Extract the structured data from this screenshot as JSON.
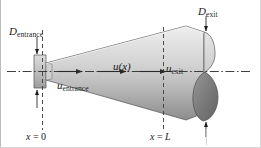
{
  "figure": {
    "colors": {
      "line": "#1a1a1a",
      "body_light": "#e4e4e4",
      "body_mid": "#c4c4c4",
      "body_dark": "#8f8f8f",
      "inner_dark": "#6f6f6f",
      "flange": "#b9b9b9",
      "border": "#b4b4b4",
      "background": "#ffffff"
    },
    "labels": {
      "d_entrance": {
        "symbol": "D",
        "subscript": "entrance"
      },
      "d_exit": {
        "symbol": "D",
        "subscript": "exit"
      },
      "u_x": {
        "symbol": "u",
        "argument": "(x)"
      },
      "u_exit": {
        "symbol": "u",
        "subscript": "exit"
      },
      "u_entrance": {
        "symbol": "u",
        "subscript": "entrance"
      },
      "x_start": {
        "variable": "x",
        "operator": "=",
        "value": "0"
      },
      "x_end": {
        "variable": "x",
        "operator": "=",
        "value": "L"
      }
    },
    "annotations": {
      "centerline": "dash-dot axis of symmetry",
      "station_lines": [
        "x = 0",
        "x = L"
      ],
      "flow_arrows": 3
    }
  }
}
